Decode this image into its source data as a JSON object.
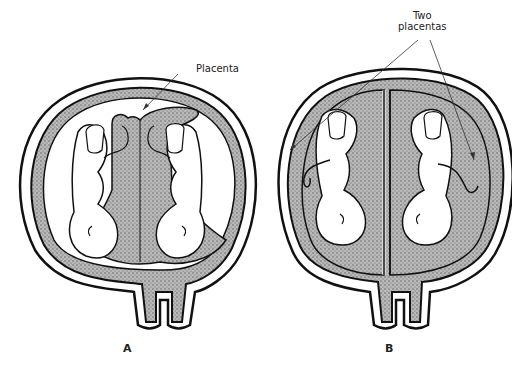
{
  "figure": {
    "panels": [
      {
        "id": "A",
        "letter": "A",
        "annotation": "Placenta",
        "description": "Twins in a single uterus sharing one fused placenta"
      },
      {
        "id": "B",
        "letter": "B",
        "annotation": "Two placentas",
        "annotation_line1": "Two",
        "annotation_line2": "placentas",
        "description": "Twins in separate sacs each with its own placenta"
      }
    ],
    "colors": {
      "outline": "#111111",
      "stipple": "#8a8a8a",
      "background": "#ffffff"
    }
  }
}
